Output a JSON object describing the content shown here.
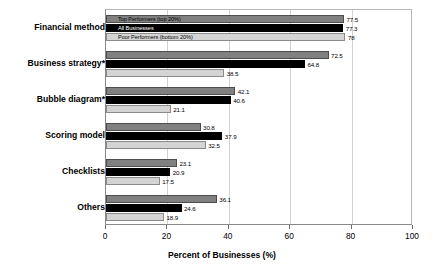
{
  "chart_data": {
    "type": "bar",
    "orientation": "horizontal",
    "title": "",
    "xlabel": "Percent of Businesses (%)",
    "ylabel": "",
    "xlim": [
      0,
      100
    ],
    "xticks": [
      0,
      20,
      40,
      60,
      80,
      100
    ],
    "grid": true,
    "legend_position": "inside-top-first-group",
    "categories": [
      "Financial method",
      "Business strategy*",
      "Bubble diagram*",
      "Scoring model",
      "Checklists",
      "Others"
    ],
    "series": [
      {
        "name": "Top Performers (top 20%)",
        "color": "#808080",
        "values": [
          77.5,
          72.5,
          42.1,
          30.8,
          23.1,
          36.1
        ]
      },
      {
        "name": "All Businesses",
        "color": "#000000",
        "values": [
          77.3,
          64.8,
          40.6,
          37.9,
          20.9,
          24.6
        ]
      },
      {
        "name": "Poor Performers (bottom 20%)",
        "color": "#d4d4d4",
        "values": [
          78,
          38.5,
          21.1,
          32.5,
          17.5,
          18.9
        ]
      }
    ]
  }
}
